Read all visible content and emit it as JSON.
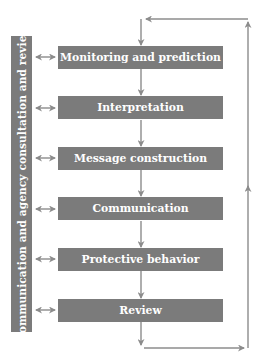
{
  "diagram": {
    "type": "process-flow",
    "sidebar": {
      "label": "Communication and agency consultation and review"
    },
    "steps": [
      {
        "label": "Monitoring and prediction"
      },
      {
        "label": "Interpretation"
      },
      {
        "label": "Message construction"
      },
      {
        "label": "Communication"
      },
      {
        "label": "Protective behavior"
      },
      {
        "label": "Review"
      }
    ],
    "connections": {
      "sequential": "each step flows downward to the next",
      "sidebar_links": "bidirectional arrows between sidebar and each step",
      "feedback_loop": "Review loops back to Monitoring and prediction via right-side line"
    },
    "colors": {
      "box_fill": "#7b7b7b",
      "box_text": "#ffffff",
      "arrow": "#8c8c8c",
      "background": "#ffffff"
    }
  }
}
